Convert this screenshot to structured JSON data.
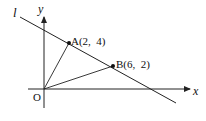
{
  "diagram": {
    "type": "coordinate-geometry",
    "line_label": "l",
    "x_axis_label": "x",
    "y_axis_label": "y",
    "origin_label": "O",
    "points": [
      {
        "name": "A",
        "label": "A(2,  4)",
        "x": 2,
        "y": 4
      },
      {
        "name": "B",
        "label": "B(6,  2)",
        "x": 6,
        "y": 2
      }
    ],
    "segments": [
      "OA",
      "OB"
    ],
    "colors": {
      "stroke": "#222222",
      "text": "#111111",
      "background": "#ffffff"
    }
  }
}
